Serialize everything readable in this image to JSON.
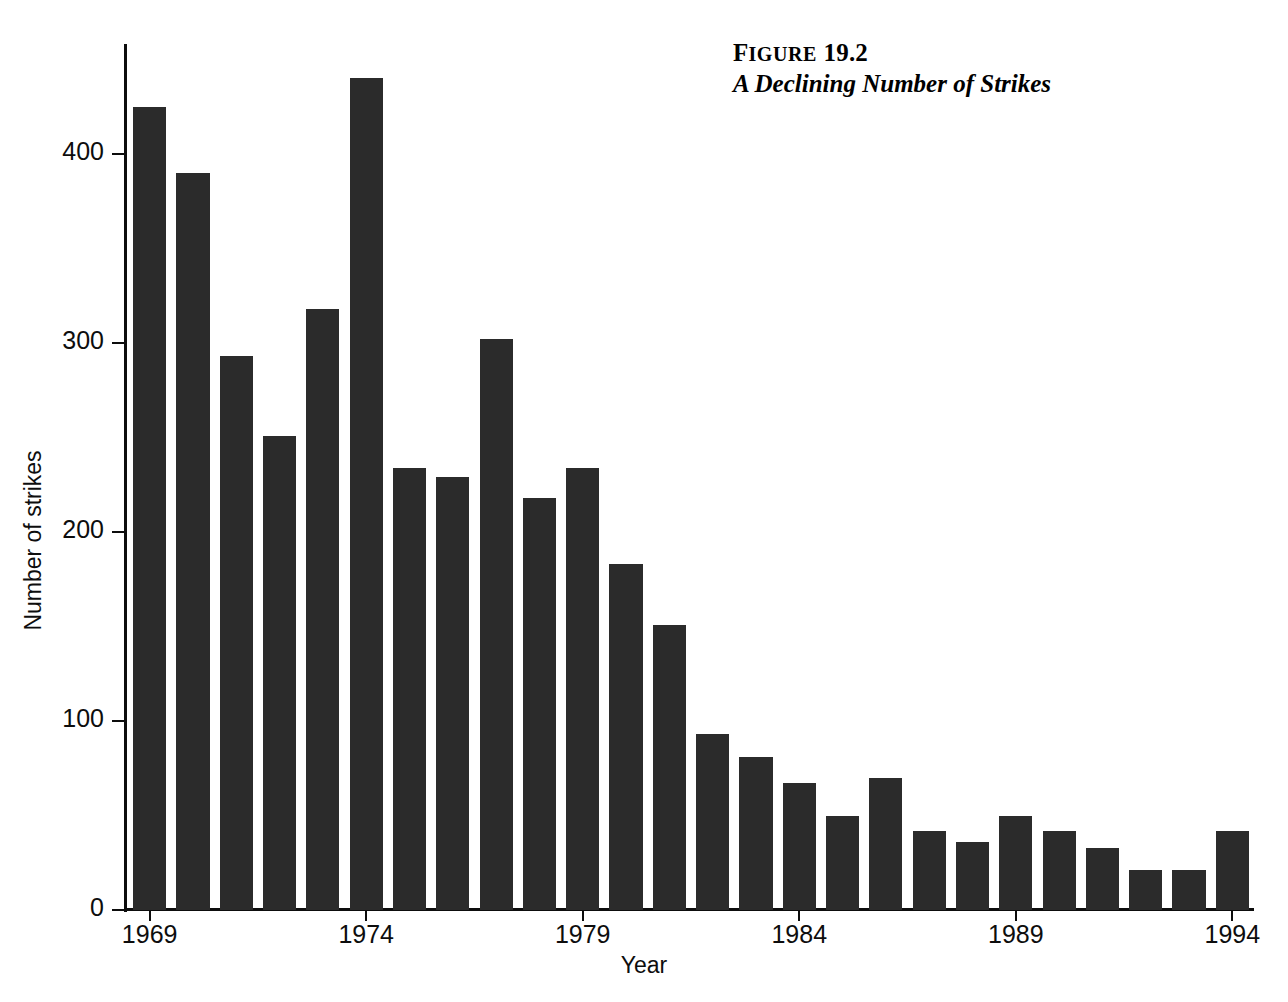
{
  "figure": {
    "number_prefix": "F",
    "number_smallcaps": "IGURE",
    "number": "19.2",
    "title": "A Declining Number of Strikes"
  },
  "axes": {
    "y_title": "Number of strikes",
    "x_title": "Year",
    "y_ticks": [
      "0",
      "100",
      "200",
      "300",
      "400"
    ],
    "x_ticks": [
      "1969",
      "1974",
      "1979",
      "1984",
      "1989",
      "1994"
    ]
  },
  "colors": {
    "bar": "#2b2b2b",
    "axis": "#0d0d0d",
    "background": "#ffffff",
    "text": "#000000"
  },
  "chart_data": {
    "type": "bar",
    "title": "A Declining Number of Strikes",
    "xlabel": "Year",
    "ylabel": "Number of strikes",
    "ylim": [
      0,
      450
    ],
    "yticks": [
      0,
      100,
      200,
      300,
      400
    ],
    "xtick_labels": [
      1969,
      1974,
      1979,
      1984,
      1989,
      1994
    ],
    "grid": false,
    "legend": null,
    "categories": [
      "1969",
      "1970",
      "1971",
      "1972",
      "1973",
      "1974",
      "1975",
      "1976",
      "1977",
      "1978",
      "1979",
      "1980",
      "1981",
      "1982",
      "1983",
      "1984",
      "1985",
      "1986",
      "1987",
      "1988",
      "1989",
      "1990",
      "1991",
      "1992",
      "1993",
      "1994"
    ],
    "values": [
      425,
      390,
      293,
      251,
      318,
      440,
      234,
      229,
      302,
      218,
      234,
      183,
      151,
      93,
      81,
      67,
      50,
      70,
      42,
      36,
      50,
      42,
      33,
      21,
      21,
      42
    ]
  }
}
